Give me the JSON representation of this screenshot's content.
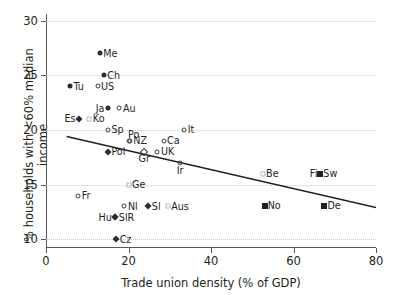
{
  "chart_data": {
    "type": "scatter",
    "title": "",
    "xlabel": "Trade union density (% of GDP)",
    "ylabel": "% households with <60% median income",
    "xlim": [
      0,
      80
    ],
    "ylim": [
      9.2,
      30.6
    ],
    "xticks": [
      0,
      20,
      40,
      60,
      80
    ],
    "yticks": [
      10,
      15,
      20,
      25,
      30
    ],
    "grid": "horizontal-dotted",
    "legend": "none",
    "points": [
      {
        "label": "Me",
        "x": 13.0,
        "y": 27.0,
        "marker": "circle-filled",
        "label_pos": "lab-r"
      },
      {
        "label": "Ch",
        "x": 14.0,
        "y": 25.0,
        "marker": "circle-filled",
        "label_pos": "lab-r"
      },
      {
        "label": "Tu",
        "x": 5.8,
        "y": 24.0,
        "marker": "circle-filled",
        "label_pos": "lab-r"
      },
      {
        "label": "US",
        "x": 12.5,
        "y": 24.0,
        "marker": "circle-open",
        "label_pos": "lab-r"
      },
      {
        "label": "Ja",
        "x": 15.0,
        "y": 22.0,
        "marker": "circle-filled",
        "label_pos": "lab-l"
      },
      {
        "label": "Au",
        "x": 17.8,
        "y": 22.0,
        "marker": "circle-open",
        "label_pos": "lab-r"
      },
      {
        "label": "Es",
        "x": 8.0,
        "y": 21.0,
        "marker": "diamond-filled",
        "label_pos": "lab-l"
      },
      {
        "label": "Ko",
        "x": 10.5,
        "y": 21.0,
        "marker": "square-open",
        "label_pos": "lab-r"
      },
      {
        "label": "Sp",
        "x": 15.0,
        "y": 20.0,
        "marker": "circle-open",
        "label_pos": "lab-r"
      },
      {
        "label": "It",
        "x": 33.5,
        "y": 20.0,
        "marker": "circle-open",
        "label_pos": "lab-r"
      },
      {
        "label": "Po",
        "x": 20.0,
        "y": 19.0,
        "marker": "circle-open",
        "label_pos": "lab-tr"
      },
      {
        "label": "NZ",
        "x": 20.3,
        "y": 19.0,
        "marker": "circle-open",
        "label_pos": "lab-r"
      },
      {
        "label": "Ca",
        "x": 28.5,
        "y": 19.0,
        "marker": "circle-open",
        "label_pos": "lab-r"
      },
      {
        "label": "Pol",
        "x": 15.0,
        "y": 18.0,
        "marker": "diamond-filled",
        "label_pos": "lab-r"
      },
      {
        "label": "Gr",
        "x": 23.8,
        "y": 18.0,
        "marker": "diamond-open",
        "label_pos": "lab-b"
      },
      {
        "label": "UK",
        "x": 27.0,
        "y": 18.0,
        "marker": "circle-open",
        "label_pos": "lab-r"
      },
      {
        "label": "Ir",
        "x": 32.5,
        "y": 17.0,
        "marker": "circle-open",
        "label_pos": "lab-b"
      },
      {
        "label": "Be",
        "x": 52.5,
        "y": 16.0,
        "marker": "square-open",
        "label_pos": "lab-r"
      },
      {
        "label": "Fi",
        "x": 66.5,
        "y": 16.0,
        "marker": "square-filled",
        "label_pos": "lab-l"
      },
      {
        "label": "Sw",
        "x": 66.5,
        "y": 16.0,
        "marker": "square-filled",
        "label_pos": "lab-r"
      },
      {
        "label": "Ge",
        "x": 20.0,
        "y": 15.0,
        "marker": "square-open",
        "label_pos": "lab-r"
      },
      {
        "label": "Fr",
        "x": 7.8,
        "y": 14.0,
        "marker": "circle-open",
        "label_pos": "lab-r"
      },
      {
        "label": "Nl",
        "x": 19.0,
        "y": 13.0,
        "marker": "circle-open",
        "label_pos": "lab-r"
      },
      {
        "label": "Sl",
        "x": 24.8,
        "y": 13.0,
        "marker": "diamond-filled",
        "label_pos": "lab-r"
      },
      {
        "label": "Aus",
        "x": 29.5,
        "y": 13.0,
        "marker": "square-open",
        "label_pos": "lab-r"
      },
      {
        "label": "No",
        "x": 53.0,
        "y": 13.0,
        "marker": "square-filled",
        "label_pos": "lab-r"
      },
      {
        "label": "De",
        "x": 67.5,
        "y": 13.0,
        "marker": "square-filled",
        "label_pos": "lab-r"
      },
      {
        "label": "Hu",
        "x": 16.8,
        "y": 12.0,
        "marker": "diamond-filled",
        "label_pos": "lab-l"
      },
      {
        "label": "SlR",
        "x": 16.8,
        "y": 12.0,
        "marker": "diamond-filled",
        "label_pos": "lab-r"
      },
      {
        "label": "Cz",
        "x": 17.0,
        "y": 10.0,
        "marker": "diamond-filled",
        "label_pos": "lab-r"
      }
    ],
    "trendline": {
      "x0": 5.0,
      "y0": 19.4,
      "x1": 80.0,
      "y1": 12.9,
      "color": "#231f20"
    }
  }
}
